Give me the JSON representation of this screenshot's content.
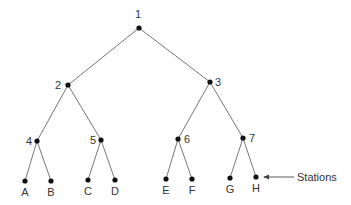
{
  "diagram": {
    "type": "binary-tree",
    "colors": {
      "edge": "#666666",
      "node": "#111111",
      "text": "#333333"
    },
    "nodes": [
      {
        "id": "1",
        "label": "1",
        "x": 139,
        "y": 28,
        "lx": 138,
        "ly": 18,
        "anchor": "middle"
      },
      {
        "id": "2",
        "label": "2",
        "x": 68,
        "y": 85,
        "lx": 61,
        "ly": 89,
        "anchor": "end"
      },
      {
        "id": "3",
        "label": "3",
        "x": 210,
        "y": 82,
        "lx": 215,
        "ly": 86,
        "anchor": "start"
      },
      {
        "id": "4",
        "label": "4",
        "x": 37,
        "y": 141,
        "lx": 32,
        "ly": 145,
        "anchor": "end"
      },
      {
        "id": "5",
        "label": "5",
        "x": 101,
        "y": 140,
        "lx": 96,
        "ly": 144,
        "anchor": "end"
      },
      {
        "id": "6",
        "label": "6",
        "x": 178,
        "y": 139,
        "lx": 184,
        "ly": 143,
        "anchor": "start"
      },
      {
        "id": "7",
        "label": "7",
        "x": 243,
        "y": 138,
        "lx": 249,
        "ly": 142,
        "anchor": "start"
      },
      {
        "id": "A",
        "label": "A",
        "x": 25,
        "y": 181,
        "lx": 25,
        "ly": 196,
        "anchor": "middle"
      },
      {
        "id": "B",
        "label": "B",
        "x": 51,
        "y": 181,
        "lx": 51,
        "ly": 196,
        "anchor": "middle"
      },
      {
        "id": "C",
        "label": "C",
        "x": 88,
        "y": 180,
        "lx": 88,
        "ly": 195,
        "anchor": "middle"
      },
      {
        "id": "D",
        "label": "D",
        "x": 115,
        "y": 180,
        "lx": 115,
        "ly": 195,
        "anchor": "middle"
      },
      {
        "id": "E",
        "label": "E",
        "x": 166,
        "y": 179,
        "lx": 166,
        "ly": 194,
        "anchor": "middle"
      },
      {
        "id": "F",
        "label": "F",
        "x": 192,
        "y": 179,
        "lx": 192,
        "ly": 194,
        "anchor": "middle"
      },
      {
        "id": "G",
        "label": "G",
        "x": 230,
        "y": 178,
        "lx": 230,
        "ly": 193,
        "anchor": "middle"
      },
      {
        "id": "H",
        "label": "H",
        "x": 256,
        "y": 177,
        "lx": 256,
        "ly": 192,
        "anchor": "middle"
      }
    ],
    "edges": [
      [
        "1",
        "2"
      ],
      [
        "1",
        "3"
      ],
      [
        "2",
        "4"
      ],
      [
        "2",
        "5"
      ],
      [
        "3",
        "6"
      ],
      [
        "3",
        "7"
      ],
      [
        "4",
        "A"
      ],
      [
        "4",
        "B"
      ],
      [
        "5",
        "C"
      ],
      [
        "5",
        "D"
      ],
      [
        "6",
        "E"
      ],
      [
        "6",
        "F"
      ],
      [
        "7",
        "G"
      ],
      [
        "7",
        "H"
      ]
    ],
    "annotation": {
      "text": "Stations",
      "target": "H",
      "arrow_from": [
        294,
        177
      ],
      "arrow_to": [
        264,
        177
      ],
      "text_x": 297,
      "text_y": 181
    }
  }
}
